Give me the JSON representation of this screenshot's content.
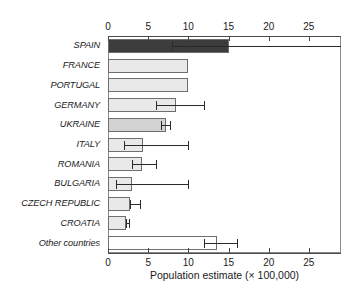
{
  "chart_data": {
    "type": "bar",
    "orientation": "horizontal",
    "title": "",
    "xlabel": "Population estimate (× 100,000)",
    "ylabel": "",
    "xlim": [
      0,
      29
    ],
    "xticks": [
      0,
      5,
      10,
      15,
      20,
      25
    ],
    "xtick_labels": [
      "0",
      "5",
      "10",
      "15",
      "20",
      "25"
    ],
    "grid": false,
    "legend": "none",
    "axis_positions": [
      "top",
      "bottom"
    ],
    "categories": [
      "SPAIN",
      "FRANCE",
      "PORTUGAL",
      "GERMANY",
      "UKRAINE",
      "ITALY",
      "ROMANIA",
      "BULGARIA",
      "CZECH REPUBLIC",
      "CROATIA",
      "Other countries"
    ],
    "values": [
      15.1,
      10.0,
      10.0,
      8.5,
      7.2,
      4.4,
      4.2,
      3.0,
      2.7,
      2.3,
      13.6
    ],
    "error_low": [
      8.0,
      null,
      null,
      6.0,
      6.6,
      2.0,
      3.0,
      1.0,
      2.7,
      2.2,
      11.9
    ],
    "error_high": [
      29.0,
      null,
      null,
      12.0,
      7.7,
      10.0,
      6.0,
      10.0,
      4.0,
      2.6,
      16.1
    ],
    "bar_colors": [
      "#3c3c3c",
      "#e9e9e9",
      "#e9e9e9",
      "#e9e9e9",
      "#d2d2d2",
      "#e9e9e9",
      "#e9e9e9",
      "#e9e9e9",
      "#e9e9e9",
      "#e9e9e9",
      "#ffffff"
    ],
    "bar_edge_color": "#6e6e6e",
    "error_bar_color": "#2a2a2a",
    "axis_color": "#4a4a4a"
  }
}
